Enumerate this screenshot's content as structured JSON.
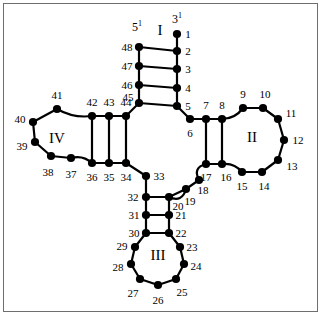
{
  "figure": {
    "type": "rna-secondary-structure-cloverleaf",
    "border_color": "#6e6e6e",
    "background": "#ffffff",
    "node_color": "#000000",
    "edge_color": "#000000",
    "width": 323,
    "height": 318
  },
  "terminals": [
    {
      "id": "five-prime",
      "text": "5",
      "sup": "1",
      "x": 137,
      "y": 26
    },
    {
      "id": "three-prime",
      "text": "3",
      "sup": "1",
      "x": 177,
      "y": 18
    }
  ],
  "arm_labels": [
    {
      "id": "arm-I",
      "text": "I",
      "x": 160,
      "y": 30
    },
    {
      "id": "arm-II",
      "text": "II",
      "x": 252,
      "y": 137
    },
    {
      "id": "arm-III",
      "text": "III",
      "x": 158,
      "y": 255
    },
    {
      "id": "arm-IV",
      "text": "IV",
      "x": 57,
      "y": 138
    }
  ],
  "nodes": [
    {
      "n": 1,
      "x": 177,
      "y": 34,
      "lx": 188,
      "ly": 34
    },
    {
      "n": 2,
      "x": 177,
      "y": 51,
      "lx": 188,
      "ly": 51
    },
    {
      "n": 3,
      "x": 177,
      "y": 69,
      "lx": 188,
      "ly": 69
    },
    {
      "n": 4,
      "x": 177,
      "y": 88,
      "lx": 188,
      "ly": 88
    },
    {
      "n": 5,
      "x": 177,
      "y": 106,
      "lx": 188,
      "ly": 106
    },
    {
      "n": 6,
      "x": 190,
      "y": 119,
      "lx": 190,
      "ly": 133
    },
    {
      "n": 7,
      "x": 206,
      "y": 119,
      "lx": 206,
      "ly": 105
    },
    {
      "n": 8,
      "x": 222,
      "y": 119,
      "lx": 222,
      "ly": 105
    },
    {
      "n": 9,
      "x": 243,
      "y": 108,
      "lx": 243,
      "ly": 94
    },
    {
      "n": 10,
      "x": 263,
      "y": 108,
      "lx": 265,
      "ly": 94
    },
    {
      "n": 11,
      "x": 278,
      "y": 119,
      "lx": 291,
      "ly": 113
    },
    {
      "n": 12,
      "x": 284,
      "y": 140,
      "lx": 298,
      "ly": 140
    },
    {
      "n": 13,
      "x": 278,
      "y": 160,
      "lx": 292,
      "ly": 166
    },
    {
      "n": 14,
      "x": 262,
      "y": 172,
      "lx": 264,
      "ly": 186
    },
    {
      "n": 15,
      "x": 242,
      "y": 172,
      "lx": 242,
      "ly": 186
    },
    {
      "n": 16,
      "x": 222,
      "y": 164,
      "lx": 226,
      "ly": 177
    },
    {
      "n": 17,
      "x": 206,
      "y": 164,
      "lx": 206,
      "ly": 177
    },
    {
      "n": 18,
      "x": 199,
      "y": 180,
      "lx": 203,
      "ly": 190
    },
    {
      "n": 19,
      "x": 186,
      "y": 189,
      "lx": 190,
      "ly": 201
    },
    {
      "n": 20,
      "x": 169,
      "y": 197,
      "lx": 178,
      "ly": 206
    },
    {
      "n": 21,
      "x": 169,
      "y": 215,
      "lx": 181,
      "ly": 215
    },
    {
      "n": 22,
      "x": 169,
      "y": 233,
      "lx": 181,
      "ly": 233
    },
    {
      "n": 23,
      "x": 180,
      "y": 247,
      "lx": 192,
      "ly": 247
    },
    {
      "n": 24,
      "x": 184,
      "y": 264,
      "lx": 196,
      "ly": 266
    },
    {
      "n": 25,
      "x": 176,
      "y": 279,
      "lx": 182,
      "ly": 292
    },
    {
      "n": 26,
      "x": 158,
      "y": 285,
      "lx": 158,
      "ly": 300
    },
    {
      "n": 27,
      "x": 140,
      "y": 279,
      "lx": 133,
      "ly": 293
    },
    {
      "n": 28,
      "x": 131,
      "y": 264,
      "lx": 118,
      "ly": 267
    },
    {
      "n": 29,
      "x": 135,
      "y": 247,
      "lx": 122,
      "ly": 246
    },
    {
      "n": 30,
      "x": 146,
      "y": 233,
      "lx": 134,
      "ly": 233
    },
    {
      "n": 31,
      "x": 146,
      "y": 215,
      "lx": 134,
      "ly": 215
    },
    {
      "n": 32,
      "x": 146,
      "y": 197,
      "lx": 133,
      "ly": 197
    },
    {
      "n": 33,
      "x": 146,
      "y": 176,
      "lx": 159,
      "ly": 176
    },
    {
      "n": 34,
      "x": 126,
      "y": 163,
      "lx": 126,
      "ly": 177
    },
    {
      "n": 35,
      "x": 109,
      "y": 163,
      "lx": 109,
      "ly": 177
    },
    {
      "n": 36,
      "x": 92,
      "y": 163,
      "lx": 92,
      "ly": 177
    },
    {
      "n": 37,
      "x": 71,
      "y": 158,
      "lx": 71,
      "ly": 174
    },
    {
      "n": 38,
      "x": 51,
      "y": 156,
      "lx": 48,
      "ly": 172
    },
    {
      "n": 39,
      "x": 35,
      "y": 142,
      "lx": 22,
      "ly": 146
    },
    {
      "n": 40,
      "x": 33,
      "y": 122,
      "lx": 20,
      "ly": 119
    },
    {
      "n": 41,
      "x": 57,
      "y": 109,
      "lx": 57,
      "ly": 95
    },
    {
      "n": 42,
      "x": 92,
      "y": 116,
      "lx": 92,
      "ly": 102
    },
    {
      "n": 43,
      "x": 109,
      "y": 116,
      "lx": 109,
      "ly": 102
    },
    {
      "n": 44,
      "x": 126,
      "y": 116,
      "lx": 126,
      "ly": 102
    },
    {
      "n": 45,
      "x": 139,
      "y": 103,
      "lx": 128,
      "ly": 97
    },
    {
      "n": 46,
      "x": 139,
      "y": 85,
      "lx": 127,
      "ly": 85
    },
    {
      "n": 47,
      "x": 139,
      "y": 66,
      "lx": 127,
      "ly": 66
    },
    {
      "n": 48,
      "x": 139,
      "y": 47,
      "lx": 127,
      "ly": 47
    }
  ],
  "backbone_edges": [
    [
      1,
      2
    ],
    [
      2,
      3
    ],
    [
      3,
      4
    ],
    [
      4,
      5
    ],
    [
      5,
      6
    ],
    [
      6,
      7
    ],
    [
      7,
      8
    ],
    [
      9,
      10
    ],
    [
      10,
      11
    ],
    [
      11,
      12
    ],
    [
      12,
      13
    ],
    [
      13,
      14
    ],
    [
      14,
      15
    ],
    [
      16,
      17
    ],
    [
      18,
      19
    ],
    [
      19,
      20
    ],
    [
      20,
      21
    ],
    [
      21,
      22
    ],
    [
      22,
      23
    ],
    [
      23,
      24
    ],
    [
      24,
      25
    ],
    [
      25,
      26
    ],
    [
      26,
      27
    ],
    [
      27,
      28
    ],
    [
      28,
      29
    ],
    [
      29,
      30
    ],
    [
      30,
      31
    ],
    [
      31,
      32
    ],
    [
      32,
      33
    ],
    [
      33,
      34
    ],
    [
      34,
      35
    ],
    [
      35,
      36
    ],
    [
      37,
      38
    ],
    [
      38,
      39
    ],
    [
      39,
      40
    ],
    [
      40,
      41
    ],
    [
      42,
      43
    ],
    [
      43,
      44
    ],
    [
      44,
      45
    ],
    [
      45,
      46
    ],
    [
      46,
      47
    ],
    [
      47,
      48
    ]
  ],
  "pair_edges": [
    [
      48,
      2
    ],
    [
      47,
      3
    ],
    [
      46,
      4
    ],
    [
      45,
      5
    ],
    [
      8,
      16
    ],
    [
      7,
      17
    ],
    [
      42,
      36
    ],
    [
      43,
      35
    ],
    [
      44,
      34
    ],
    [
      32,
      20
    ],
    [
      31,
      21
    ],
    [
      30,
      22
    ]
  ],
  "curved_edges": [
    {
      "from": 8,
      "to": 9,
      "note": "stem-to-loop-arm-II-left"
    },
    {
      "from": 15,
      "to": 16,
      "note": "loop-to-stem-arm-II-right"
    },
    {
      "from": 17,
      "to": 18,
      "note": "junction-arc-right"
    },
    {
      "from": 20,
      "to": 19,
      "note": "junction-arc-bottom"
    },
    {
      "from": 36,
      "to": 37,
      "note": "stem-to-loop-arm-IV-lower"
    },
    {
      "from": 41,
      "to": 42,
      "note": "loop-to-stem-arm-IV-upper"
    }
  ]
}
